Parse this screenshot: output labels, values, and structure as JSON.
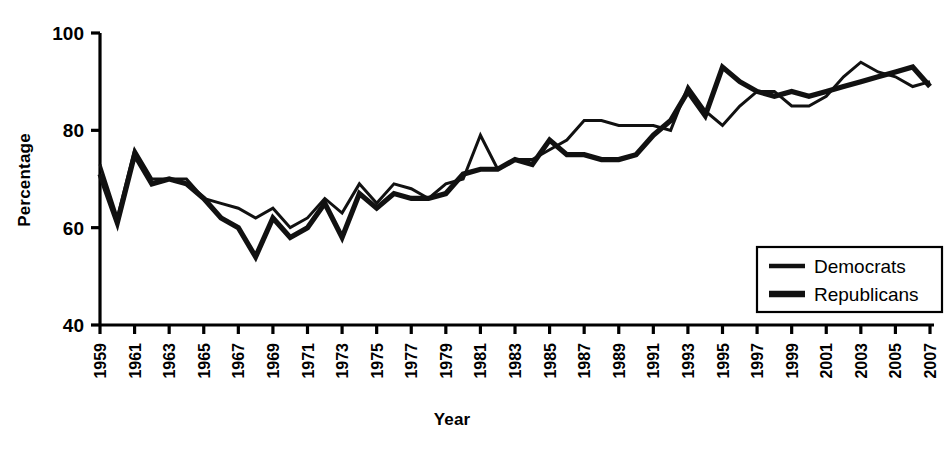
{
  "chart_data": {
    "type": "line",
    "title": "",
    "xlabel": "Year",
    "ylabel": "Percentage",
    "xlim": [
      1959,
      2007
    ],
    "ylim": [
      40,
      100
    ],
    "yticks": [
      40,
      60,
      80,
      100
    ],
    "xticks": [
      1959,
      1961,
      1963,
      1965,
      1967,
      1969,
      1971,
      1973,
      1975,
      1977,
      1979,
      1981,
      1983,
      1985,
      1987,
      1989,
      1991,
      1993,
      1995,
      1997,
      1999,
      2001,
      2003,
      2005,
      2007
    ],
    "grid": false,
    "legend_position": "bottom-right",
    "x": [
      1959,
      1960,
      1961,
      1962,
      1963,
      1964,
      1965,
      1966,
      1967,
      1968,
      1969,
      1970,
      1971,
      1972,
      1973,
      1974,
      1975,
      1976,
      1977,
      1978,
      1979,
      1980,
      1981,
      1982,
      1983,
      1984,
      1985,
      1986,
      1987,
      1988,
      1989,
      1990,
      1991,
      1992,
      1993,
      1994,
      1995,
      1996,
      1997,
      1998,
      1999,
      2000,
      2001,
      2002,
      2003,
      2004,
      2005,
      2006,
      2007
    ],
    "series": [
      {
        "name": "Democrats",
        "values": [
          73,
          62,
          76,
          70,
          70,
          70,
          66,
          65,
          64,
          62,
          64,
          60,
          62,
          66,
          63,
          69,
          65,
          69,
          68,
          66,
          69,
          70,
          79,
          72,
          74,
          74,
          76,
          78,
          82,
          82,
          81,
          81,
          81,
          80,
          89,
          84,
          81,
          85,
          88,
          88,
          85,
          85,
          87,
          91,
          94,
          92,
          91,
          89,
          90
        ],
        "style": "thin"
      },
      {
        "name": "Republicans",
        "values": [
          71,
          61,
          75,
          69,
          70,
          69,
          66,
          62,
          60,
          54,
          62,
          58,
          60,
          65,
          58,
          67,
          64,
          67,
          66,
          66,
          67,
          71,
          72,
          72,
          74,
          73,
          78,
          75,
          75,
          74,
          74,
          75,
          79,
          82,
          88,
          83,
          93,
          90,
          88,
          87,
          88,
          87,
          88,
          89,
          90,
          91,
          92,
          93,
          89
        ],
        "style": "thick"
      }
    ]
  },
  "legend": {
    "items": [
      {
        "label": "Democrats"
      },
      {
        "label": "Republicans"
      }
    ]
  },
  "axes": {
    "y_label": "Percentage",
    "x_label": "Year"
  }
}
